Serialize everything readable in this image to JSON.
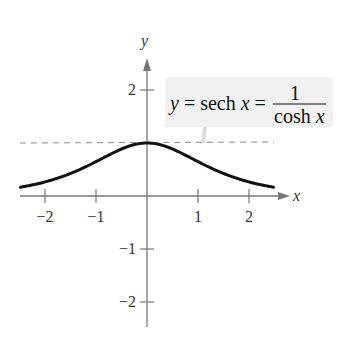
{
  "chart_data": {
    "type": "line",
    "title": "",
    "function": "y = sech x = 1 / cosh x",
    "xlabel": "x",
    "ylabel": "y",
    "xlim": [
      -2.5,
      2.5
    ],
    "ylim": [
      -2.5,
      2.5
    ],
    "xticks": [
      -2,
      -1,
      1,
      2
    ],
    "yticks": [
      2,
      -1,
      -2
    ],
    "xtick_labels": [
      "−2",
      "−1",
      "1",
      "2"
    ],
    "ytick_labels": [
      "2",
      "−1",
      "−2"
    ],
    "grid": false,
    "asymptote_line": {
      "y": 1,
      "style": "dashed",
      "note": "horizontal reference at y = 1 (maximum)"
    },
    "series": [
      {
        "name": "y = sech x",
        "x": [
          -2.5,
          -2,
          -1.5,
          -1,
          -0.5,
          0,
          0.5,
          1,
          1.5,
          2,
          2.5
        ],
        "values": [
          0.163,
          0.266,
          0.425,
          0.648,
          0.887,
          1.0,
          0.887,
          0.648,
          0.425,
          0.266,
          0.163
        ]
      }
    ],
    "annotation": {
      "lhs": "y = sech x =",
      "numerator": "1",
      "denominator": "cosh x"
    }
  },
  "colors": {
    "curve": "#111111",
    "axes": "#777777",
    "label_box": "#f1f1f1"
  }
}
